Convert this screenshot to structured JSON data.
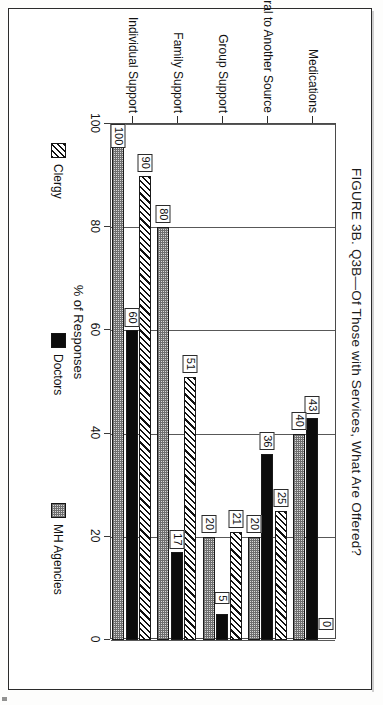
{
  "figure": {
    "title": "FIGURE 3B. Q3B—Of Those with Services, What Are Offered?"
  },
  "chart_data": {
    "type": "bar",
    "orientation": "horizontal",
    "title": "FIGURE 3B. Q3B—Of Those with Services, What Are Offered?",
    "xlabel": "",
    "ylabel": "% of Responses",
    "ylim": [
      0,
      100
    ],
    "yticks": [
      "0",
      "20",
      "40",
      "60",
      "80",
      "100"
    ],
    "grid": true,
    "legend_position": "bottom",
    "categories": [
      "Individual Support",
      "Family Support",
      "Group Support",
      "Referral to Another Source",
      "Medications"
    ],
    "series": [
      {
        "name": "Clergy",
        "values": [
          90,
          51,
          21,
          25,
          0
        ],
        "pattern": "diagonal-hatch"
      },
      {
        "name": "Doctors",
        "values": [
          60,
          17,
          5,
          36,
          43
        ],
        "pattern": "solid-black"
      },
      {
        "name": "MH Agencies",
        "values": [
          100,
          80,
          20,
          20,
          40
        ],
        "pattern": "stipple-gray"
      }
    ],
    "data_labels": {
      "Individual Support": {
        "Clergy": "90",
        "Doctors": "60",
        "MH Agencies": "100"
      },
      "Family Support": {
        "Clergy": "51",
        "Doctors": "17",
        "MH Agencies": "80"
      },
      "Group Support": {
        "Clergy": "21",
        "Doctors": "5",
        "MH Agencies": "20"
      },
      "Referral to Another Source": {
        "Clergy": "25",
        "Doctors": "36",
        "MH Agencies": "20"
      },
      "Medications": {
        "Clergy": "0",
        "Doctors": "43",
        "MH Agencies": "40"
      }
    }
  },
  "axis": {
    "value_title": "% of Responses",
    "ticks": [
      "0",
      "20",
      "40",
      "60",
      "80",
      "100"
    ]
  },
  "legend": {
    "items": [
      {
        "label": "Clergy",
        "pattern": "diagonal-hatch"
      },
      {
        "label": "Doctors",
        "pattern": "solid-black"
      },
      {
        "label": "MH Agencies",
        "pattern": "stipple-gray"
      }
    ]
  },
  "colors": {
    "frame": "#2b2b2b",
    "axis": "#4a4a4a",
    "bar_doctors": "#0c0c0c",
    "bar_mh": "#d7d7d7",
    "background": "#ffffff"
  }
}
